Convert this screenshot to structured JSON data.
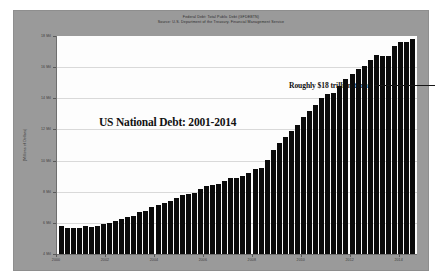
{
  "header": {
    "line1": "Federal Debt: Total Public Debt (GFDEBTN)",
    "line2": "Source: U.S. Department of the Treasury. Financial Management Service"
  },
  "annotations": {
    "chart_title": "US National Debt:  2001-2014",
    "callout": "Roughly $18 trillion today"
  },
  "chart_data": {
    "type": "bar",
    "title": "Federal Debt: Total Public Debt (GFDEBTN)",
    "subtitle": "Source: U.S. Department of the Treasury. Financial Management Service",
    "xlabel": "",
    "ylabel": "(Millions of Dollars)",
    "ylim": [
      4000000,
      18000000
    ],
    "ytick_labels": [
      "18 Mil",
      "16 Mil",
      "14 Mil",
      "12 Mil",
      "10 Mil",
      "8 Mil",
      "6 Mil",
      "4 Mil"
    ],
    "ytick_values": [
      18000000,
      16000000,
      14000000,
      12000000,
      10000000,
      8000000,
      6000000,
      4000000
    ],
    "xtick_labels": [
      "2000",
      "2002",
      "2004",
      "2006",
      "2008",
      "2010",
      "2012",
      "2014"
    ],
    "xtick_values": [
      2000,
      2002,
      2004,
      2006,
      2008,
      2010,
      2012,
      2014
    ],
    "xlim": [
      2000,
      2014.75
    ],
    "grid": "horizontal",
    "legend": "none",
    "bar_color": "#0b0b0b",
    "plot_background": "#fdfdfd",
    "panel_background": "#9a9a9a",
    "annotations": [
      {
        "text": "US National Debt:  2001-2014",
        "x": 2002.2,
        "y": 15600000
      },
      {
        "text": "Roughly $18 trillion today",
        "x": 2011.2,
        "y": 17400000
      }
    ],
    "x": [
      2000.0,
      2000.25,
      2000.5,
      2000.75,
      2001.0,
      2001.25,
      2001.5,
      2001.75,
      2002.0,
      2002.25,
      2002.5,
      2002.75,
      2003.0,
      2003.25,
      2003.5,
      2003.75,
      2004.0,
      2004.25,
      2004.5,
      2004.75,
      2005.0,
      2005.25,
      2005.5,
      2005.75,
      2006.0,
      2006.25,
      2006.5,
      2006.75,
      2007.0,
      2007.25,
      2007.5,
      2007.75,
      2008.0,
      2008.25,
      2008.5,
      2008.75,
      2009.0,
      2009.25,
      2009.5,
      2009.75,
      2010.0,
      2010.25,
      2010.5,
      2010.75,
      2011.0,
      2011.25,
      2011.5,
      2011.75,
      2012.0,
      2012.25,
      2012.5,
      2012.75,
      2013.0,
      2013.25,
      2013.5,
      2013.75,
      2014.0,
      2014.25,
      2014.5
    ],
    "values": [
      5773000,
      5686000,
      5674000,
      5662000,
      5774000,
      5726000,
      5808000,
      5943000,
      6006000,
      6126000,
      6228000,
      6405000,
      6460000,
      6670000,
      6783000,
      6998000,
      7131000,
      7274000,
      7379000,
      7596000,
      7776000,
      7836000,
      7933000,
      8170000,
      8371000,
      8420000,
      8507000,
      8680000,
      8850000,
      8868000,
      9008000,
      9229000,
      9438000,
      9492000,
      10025000,
      10700000,
      11127000,
      11546000,
      11910000,
      12311000,
      12773000,
      13202000,
      13562000,
      14025000,
      14270000,
      14343000,
      14790000,
      15223000,
      15582000,
      15856000,
      16066000,
      16433000,
      16772000,
      16738000,
      16738000,
      17352000,
      17601000,
      17632000,
      17824000
    ]
  }
}
